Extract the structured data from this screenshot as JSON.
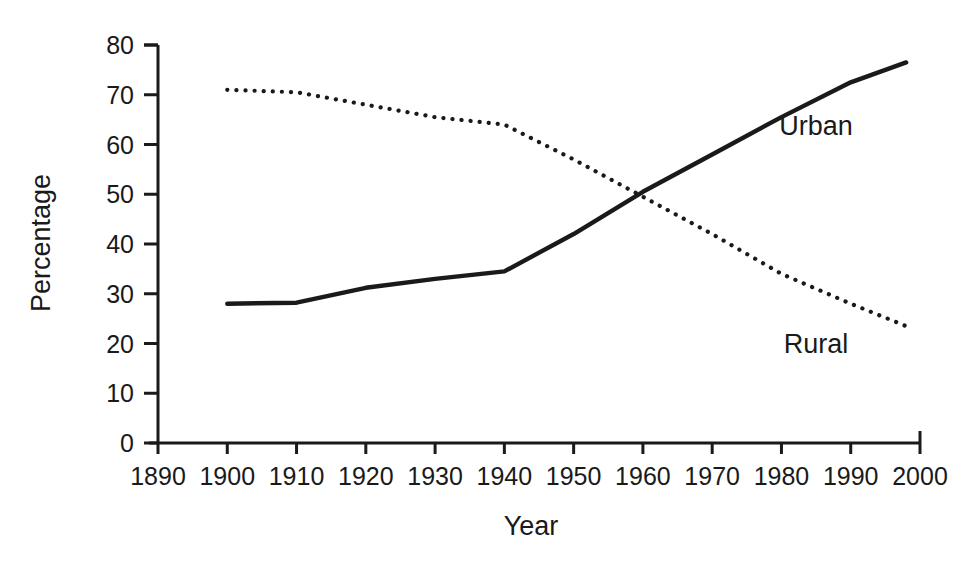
{
  "chart_data": {
    "type": "line",
    "title": "",
    "subtitle": "",
    "xlabel": "Year",
    "ylabel": "Percentage",
    "xlim": [
      1890,
      2000
    ],
    "ylim": [
      0,
      80
    ],
    "grid": false,
    "legend_position": "inline-right",
    "xticks": [
      "1890",
      "1900",
      "1910",
      "1920",
      "1930",
      "1940",
      "1950",
      "1960",
      "1970",
      "1980",
      "1990",
      "2000"
    ],
    "yticks": [
      "0",
      "10",
      "20",
      "30",
      "40",
      "50",
      "60",
      "70",
      "80"
    ],
    "x": [
      1900,
      1910,
      1920,
      1930,
      1940,
      1950,
      1960,
      1970,
      1980,
      1990,
      1998
    ],
    "series": [
      {
        "name": "Urban",
        "style": "solid",
        "color": "#1a1a1a",
        "values": [
          28.0,
          28.2,
          31.2,
          33.0,
          34.5,
          42.0,
          50.5,
          58.0,
          65.5,
          72.5,
          76.5
        ]
      },
      {
        "name": "Rural",
        "style": "dotted",
        "color": "#1a1a1a",
        "values": [
          71.0,
          70.5,
          68.0,
          65.5,
          64.0,
          57.0,
          49.5,
          42.0,
          34.0,
          28.0,
          23.5
        ]
      }
    ],
    "annotations": [
      {
        "text": "Urban",
        "x": 1985,
        "y": 62
      },
      {
        "text": "Rural",
        "x": 1985,
        "y": 18
      }
    ]
  },
  "axis": {
    "y_title": "Percentage",
    "x_title": "Year"
  }
}
